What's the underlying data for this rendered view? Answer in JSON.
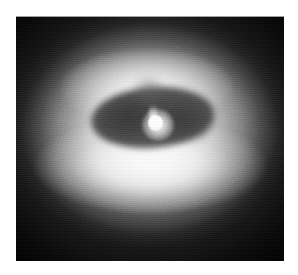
{
  "figure": {
    "name": "galaxy-dust-disk-image",
    "caption": "",
    "border_color": "#ffffff",
    "background_color": "#050505"
  },
  "image": {
    "modality": "grayscale astronomical image",
    "subject": "elliptical galaxy nucleus surrounded by a dark dust ring",
    "colormap": "grayscale",
    "alt_text": "Grayscale telescope image of a galaxy: a bright diffuse halo with a dark elliptical dust ring encircling a compact bright nucleus, set against a dark sky background.",
    "plate": {
      "left": 16,
      "top": 16,
      "width": 268,
      "height": 245
    },
    "features": [
      {
        "id": "outer-halo",
        "label": "Outer stellar halo",
        "description": "Smooth diffuse glow fading to dark sky at the plate corners",
        "center_x_pct": 50,
        "center_y_pct": 47,
        "brightness": "low-to-medium"
      },
      {
        "id": "bulge",
        "label": "Bright inner bulge",
        "description": "High surface brightness region filling the central third of the frame",
        "center_x_pct": 50,
        "center_y_pct": 46,
        "brightness": "high"
      },
      {
        "id": "dust-ring",
        "label": "Dark dust ring",
        "description": "Tilted elliptical band of obscuring dust seen in silhouette against the bulge",
        "center_x_pct": 51,
        "center_y_pct": 41,
        "position_angle_deg": -5,
        "brightness": "dark"
      },
      {
        "id": "bright-rim",
        "label": "Illuminated lower rim",
        "description": "Brightest arc of the image, just below the dust ring",
        "center_x_pct": 50,
        "center_y_pct": 61,
        "brightness": "saturated"
      },
      {
        "id": "nucleus",
        "label": "Compact nucleus",
        "description": "Unresolved point-like bright source at the centre of the dust ring",
        "center_x_pct": 52,
        "center_y_pct": 44,
        "brightness": "saturated"
      }
    ]
  }
}
